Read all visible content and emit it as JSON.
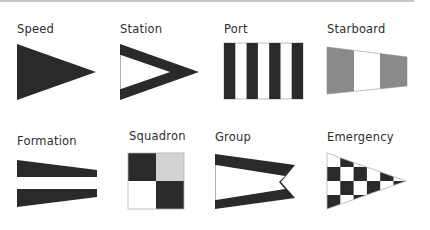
{
  "colors": {
    "dark": "#2a2a2a",
    "mid_gray": "#8a8a8a",
    "light_gray": "#d2d2d2",
    "white": "#ffffff",
    "outline": "#b0b0b0",
    "rule": "#c4c4c4"
  },
  "flags": [
    {
      "id": "speed",
      "label": "Speed",
      "shape": "triangle-solid"
    },
    {
      "id": "station",
      "label": "Station",
      "shape": "triangle-outline"
    },
    {
      "id": "port",
      "label": "Port",
      "shape": "rectangle-vertical-stripes"
    },
    {
      "id": "starboard",
      "label": "Starboard",
      "shape": "tapered-gray-white-gray"
    },
    {
      "id": "formation",
      "label": "Formation",
      "shape": "tapered-dark-white-band"
    },
    {
      "id": "squadron",
      "label": "Squadron",
      "shape": "square-quartered"
    },
    {
      "id": "group",
      "label": "Group",
      "shape": "swallowtail-outline"
    },
    {
      "id": "emergency",
      "label": "Emergency",
      "shape": "triangle-checkered"
    }
  ]
}
